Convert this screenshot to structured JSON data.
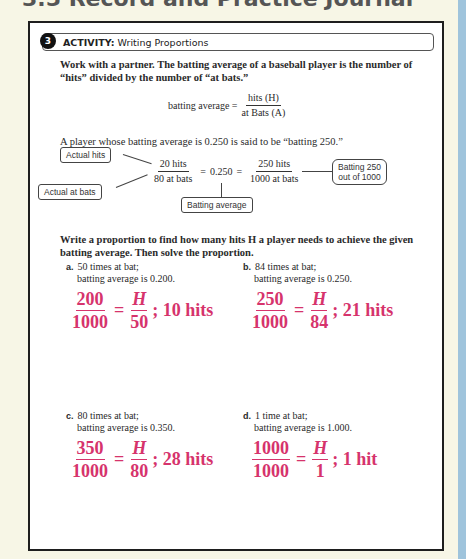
{
  "page": {
    "title": "3.5 Record and Practice Journal",
    "colors": {
      "background": "#f7f6e6",
      "answer": "#d6336c",
      "strip": "#9fc4dc",
      "border": "#1e1e1e"
    }
  },
  "activity": {
    "number": "3",
    "label": "ACTIVITY:",
    "title": "Writing Proportions",
    "intro": "Work with a partner. The batting average of a baseball player is the number of “hits” divided by the number of “at bats.”",
    "formula": {
      "lhs": "batting average =",
      "numerator": "hits (H)",
      "denominator": "at Bats (A)"
    },
    "sentence": "A player whose batting average is 0.250 is said to be “batting 250.”",
    "diagram": {
      "frac1_num": "20 hits",
      "frac1_den": "80 at bats",
      "equals1": "=",
      "decimal": "0.250",
      "equals2": "=",
      "frac2_num": "250 hits",
      "frac2_den": "1000 at bats",
      "callouts": {
        "actual_hits": "Actual hits",
        "actual_at_bats": "Actual at bats",
        "batting_average": "Batting average",
        "batting_250_line1": "Batting 250",
        "batting_250_line2": "out of 1000"
      }
    },
    "instructions": "Write a proportion to find how many hits H a player needs to achieve the given batting average. Then solve the proportion.",
    "problems": [
      {
        "letter": "a.",
        "line1": "50 times at bat;",
        "line2": "batting average is 0.200.",
        "ans_num1": "200",
        "ans_den1": "1000",
        "ans_eq": "=",
        "ans_num2": "H",
        "ans_den2": "50",
        "ans_result": "; 10 hits"
      },
      {
        "letter": "b.",
        "line1": "84 times at bat;",
        "line2": "batting average is 0.250.",
        "ans_num1": "250",
        "ans_den1": "1000",
        "ans_eq": "=",
        "ans_num2": "H",
        "ans_den2": "84",
        "ans_result": "; 21 hits"
      },
      {
        "letter": "c.",
        "line1": "80 times at bat;",
        "line2": "batting average is 0.350.",
        "ans_num1": "350",
        "ans_den1": "1000",
        "ans_eq": "=",
        "ans_num2": "H",
        "ans_den2": "80",
        "ans_result": "; 28 hits"
      },
      {
        "letter": "d.",
        "line1": "1 time at bat;",
        "line2": "batting average is 1.000.",
        "ans_num1": "1000",
        "ans_den1": "1000",
        "ans_eq": "=",
        "ans_num2": "H",
        "ans_den2": "1",
        "ans_result": "; 1 hit"
      }
    ]
  }
}
